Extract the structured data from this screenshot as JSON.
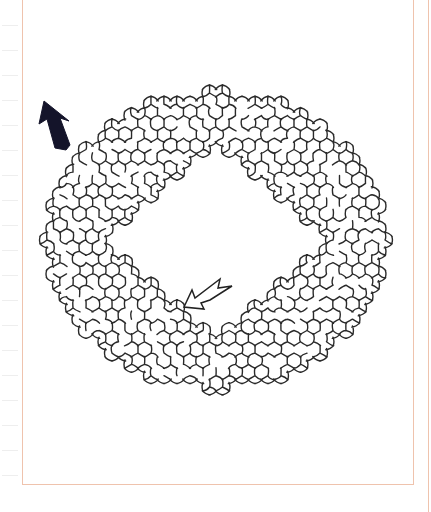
{
  "puzzle": {
    "type": "hexagonal ring maze",
    "entrance_arrow": {
      "style": "outline",
      "direction": "down-left",
      "position": "inner hole, lower-left"
    },
    "exit_arrow": {
      "style": "filled-black",
      "direction": "up-left",
      "position": "outer edge, upper-left"
    }
  },
  "colors": {
    "frame": "#efc3ad",
    "wall": "#2a2a2a",
    "exit_arrow_fill": "#14142a",
    "entrance_arrow_stroke": "#222222",
    "tick": "#eeeeee"
  },
  "maze": {
    "center_x": 216,
    "center_y": 240,
    "cell": 13,
    "outer_radius_x": 170,
    "outer_radius_y": 148,
    "hole_half_diag_x": 115,
    "hole_half_diag_y": 98,
    "seed": 7
  },
  "ticks_y": [
    25,
    50,
    75,
    100,
    125,
    150,
    175,
    200,
    225,
    250,
    275,
    300,
    325,
    350,
    375,
    400,
    425,
    450,
    475
  ]
}
